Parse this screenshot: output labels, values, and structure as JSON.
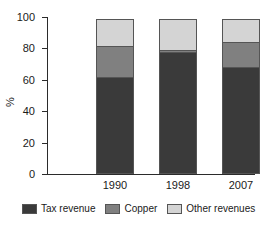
{
  "chart_data": {
    "type": "bar",
    "stacked": true,
    "title": "",
    "subtitle": "",
    "xlabel": "",
    "ylabel": "%",
    "ylim": [
      0,
      100
    ],
    "yticks": [
      0,
      20,
      40,
      60,
      80,
      100
    ],
    "ytick_labels": [
      "0",
      "20",
      "40",
      "60",
      "80",
      "100"
    ],
    "grid": false,
    "legend_position": "bottom",
    "categories": [
      "1990",
      "1998",
      "2007"
    ],
    "series": [
      {
        "name": "Tax revenue",
        "color": "#3a3a3a",
        "values": [
          62,
          78,
          68
        ]
      },
      {
        "name": "Copper",
        "color": "#808080",
        "values": [
          20,
          1.5,
          17
        ]
      },
      {
        "name": "Other revenues",
        "color": "#d4d4d4",
        "values": [
          18,
          20.5,
          15
        ]
      }
    ]
  },
  "axis": {
    "y_label": "%",
    "y_ticks": [
      {
        "value": 100,
        "label": "100"
      },
      {
        "value": 80,
        "label": "80"
      },
      {
        "value": 60,
        "label": "60"
      },
      {
        "value": 40,
        "label": "40"
      },
      {
        "value": 20,
        "label": "20"
      },
      {
        "value": 0,
        "label": "0"
      }
    ],
    "x_ticks": [
      {
        "label": "1990"
      },
      {
        "label": "1998"
      },
      {
        "label": "2007"
      }
    ]
  },
  "legend": {
    "items": [
      {
        "label": "Tax revenue",
        "color": "#3a3a3a"
      },
      {
        "label": "Copper",
        "color": "#808080"
      },
      {
        "label": "Other revenues",
        "color": "#d4d4d4"
      }
    ]
  }
}
